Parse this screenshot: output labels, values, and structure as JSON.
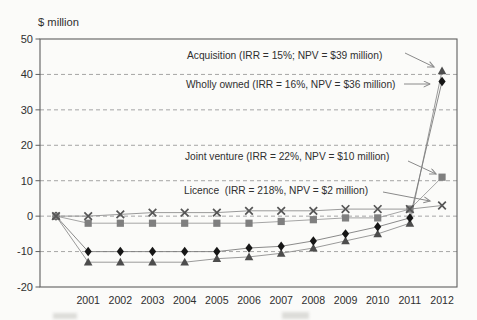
{
  "chart_data": {
    "type": "line",
    "title": "",
    "ylabel": "$ million",
    "xlabel": "",
    "x": [
      2000,
      2001,
      2002,
      2003,
      2004,
      2005,
      2006,
      2007,
      2008,
      2009,
      2010,
      2011,
      2012
    ],
    "x_tick_labels": [
      "2001",
      "2002",
      "2003",
      "2004",
      "2005",
      "2006",
      "2007",
      "2008",
      "2009",
      "2010",
      "2011",
      "2012"
    ],
    "ylim": [
      -20,
      50
    ],
    "yticks": [
      50,
      40,
      30,
      20,
      10,
      0,
      -10,
      -20
    ],
    "grid": "horizontal-dashed",
    "legend": "inline-annotations",
    "series": [
      {
        "name": "Acquisition",
        "irr": "15%",
        "npv": "$39 million",
        "marker": "triangle",
        "color": "#4d4d4d",
        "line_color": "#8f8f8f",
        "values": [
          0,
          -13,
          -13,
          -13,
          -13,
          -12,
          -11.5,
          -10.5,
          -9,
          -7,
          -5,
          -2,
          41
        ]
      },
      {
        "name": "Wholly owned",
        "irr": "16%",
        "npv": "$36 million",
        "marker": "diamond",
        "color": "#161616",
        "line_color": "#7d7d7d",
        "values": [
          0,
          -10,
          -10,
          -10,
          -10,
          -10,
          -9,
          -8.5,
          -7,
          -5,
          -3,
          -0.5,
          38
        ]
      },
      {
        "name": "Joint venture",
        "irr": "22%",
        "npv": "$10 million",
        "marker": "square",
        "color": "#7f7f7f",
        "line_color": "#9b9b9b",
        "values": [
          0,
          -2,
          -2,
          -2,
          -2,
          -2,
          -2,
          -1.5,
          -1,
          -0.5,
          -0.5,
          2,
          11
        ]
      },
      {
        "name": "Licence",
        "irr": "218%",
        "npv": "$2 million",
        "marker": "x",
        "color": "#565656",
        "line_color": "#8f8f8f",
        "values": [
          0,
          0,
          0.5,
          1,
          1,
          1,
          1.5,
          1.5,
          1.5,
          2,
          2,
          2,
          3
        ]
      }
    ],
    "annotations": [
      {
        "series": "Acquisition",
        "label": "Acquisition (IRR = 15%; NPV = $39 million)",
        "text_x": 187,
        "text_y": 59,
        "arrow": {
          "x1": 405,
          "y1": 53,
          "x2": 434,
          "y2": 67
        }
      },
      {
        "series": "Wholly owned",
        "label": "Wholly owned (IRR = 16%, NPV = $36 million)",
        "text_x": 186,
        "text_y": 88,
        "arrow": {
          "x1": 404,
          "y1": 84,
          "x2": 430,
          "y2": 84
        }
      },
      {
        "series": "Joint venture",
        "label": "Joint venture (IRR = 22%, NPV = $10 million)",
        "text_x": 185,
        "text_y": 160,
        "arrow": {
          "x1": 408,
          "y1": 161,
          "x2": 436,
          "y2": 174
        }
      },
      {
        "series": "Licence",
        "label": "Licence  (IRR = 218%, NPV = $2 million)",
        "text_x": 184,
        "text_y": 194,
        "arrow": {
          "x1": 383,
          "y1": 192,
          "x2": 430,
          "y2": 201
        }
      }
    ],
    "layout": {
      "plot": {
        "left": 40,
        "top": 39,
        "right": 457,
        "bottom": 287
      },
      "x2000_px": 56,
      "year_step_px": 32.17,
      "x_label_y": 303.5
    },
    "colors": {
      "paper": "#fbfbf9",
      "plot_border": "#5f5f5f",
      "gridline": "#9c9c9c",
      "annotation_text": "#2b2b2b",
      "arrow": "#8a8a8a",
      "tick_text": "#2f2f2f"
    }
  }
}
